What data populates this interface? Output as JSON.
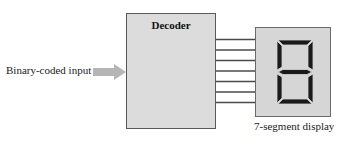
{
  "diagram": {
    "input": {
      "label": "Binary-coded input",
      "arrow_color": "#b5b5b5"
    },
    "decoder": {
      "title": "Decoder",
      "fill_color": "#dcdcdc",
      "border_color": "#5a5a5a"
    },
    "connections": {
      "count": 7,
      "line_color": "#4a4a4a"
    },
    "display": {
      "label": "7-segment display",
      "digit_shown": "8",
      "segments": [
        "a",
        "b",
        "c",
        "d",
        "e",
        "f",
        "g"
      ],
      "segment_color": "#1a1a1a",
      "fill_color": "#d6d6d6"
    }
  }
}
